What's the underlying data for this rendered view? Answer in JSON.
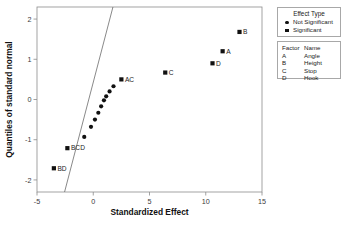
{
  "chart_data": {
    "type": "scatter",
    "title": "",
    "xlabel": "Standardized Effect",
    "ylabel": "Quantiles of standard normal",
    "xlim": [
      -5,
      15
    ],
    "ylim": [
      -2.3,
      2.3
    ],
    "xticks": [
      -5,
      0,
      5,
      10,
      15
    ],
    "yticks": [
      -2,
      -1,
      0,
      1,
      2
    ],
    "xtick_labels": [
      "-5",
      "0",
      "5",
      "10",
      "15"
    ],
    "ytick_labels": [
      "-2",
      "-1",
      "0",
      "1",
      "2"
    ],
    "grid": false,
    "legend_position": "right",
    "reference_line": {
      "label": "normal reference line",
      "x": [
        -2.55,
        1.75
      ],
      "y": [
        -2.3,
        2.3
      ]
    },
    "series": [
      {
        "name": "Not Significant",
        "marker": "circle",
        "points": [
          {
            "x": -0.8,
            "y": -0.93,
            "label": ""
          },
          {
            "x": -0.2,
            "y": -0.68,
            "label": ""
          },
          {
            "x": 0.15,
            "y": -0.5,
            "label": ""
          },
          {
            "x": 0.45,
            "y": -0.33,
            "label": ""
          },
          {
            "x": 0.7,
            "y": -0.17,
            "label": ""
          },
          {
            "x": 0.95,
            "y": -0.02,
            "label": ""
          },
          {
            "x": 1.15,
            "y": 0.08,
            "label": ""
          },
          {
            "x": 1.45,
            "y": 0.2,
            "label": ""
          },
          {
            "x": 1.8,
            "y": 0.33,
            "label": ""
          }
        ]
      },
      {
        "name": "Significant",
        "marker": "square",
        "points": [
          {
            "x": -3.5,
            "y": -1.71,
            "label": "BD"
          },
          {
            "x": -2.3,
            "y": -1.21,
            "label": "BCD"
          },
          {
            "x": 2.5,
            "y": 0.5,
            "label": "AC"
          },
          {
            "x": 6.4,
            "y": 0.67,
            "label": "C"
          },
          {
            "x": 10.6,
            "y": 0.9,
            "label": "D"
          },
          {
            "x": 11.5,
            "y": 1.2,
            "label": "A"
          },
          {
            "x": 13.0,
            "y": 1.68,
            "label": "B"
          }
        ]
      }
    ]
  },
  "legend_effect_type": {
    "title": "Effect Type",
    "items": [
      {
        "label": "Not Significant",
        "marker": "circle"
      },
      {
        "label": "Significant",
        "marker": "square"
      }
    ]
  },
  "legend_factor_name": {
    "header": {
      "factor": "Factor",
      "name": "Name"
    },
    "rows": [
      {
        "factor": "A",
        "name": "Angle"
      },
      {
        "factor": "B",
        "name": "Height"
      },
      {
        "factor": "C",
        "name": "Stop"
      },
      {
        "factor": "D",
        "name": "Hook"
      }
    ]
  },
  "colors": {
    "marker": "#111111",
    "axis": "#8c8c8c",
    "reference_line": "#6b6b6b",
    "background": "#ffffff"
  }
}
